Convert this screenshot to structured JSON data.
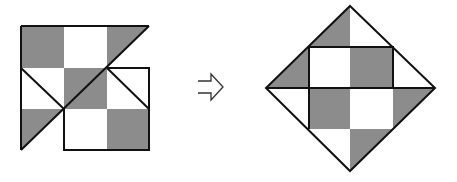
{
  "figure": {
    "colors": {
      "fill_dark": "#8c8c8c",
      "fill_light": "#ffffff",
      "stroke": "#111111"
    }
  },
  "left_shape": {
    "label": ""
  },
  "arrow": {
    "label": "",
    "icon": "outline-right-arrow"
  },
  "right_shape": {
    "label": ""
  }
}
